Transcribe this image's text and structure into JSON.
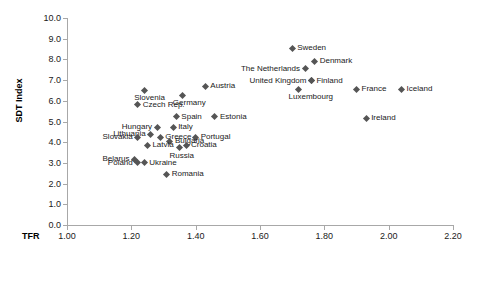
{
  "chart_data": {
    "type": "scatter",
    "title": "",
    "xlabel": "TFR",
    "ylabel": "SDT Index",
    "xlim": [
      1.0,
      2.2
    ],
    "ylim": [
      0.0,
      10.0
    ],
    "xticks": [
      "1.00",
      "1.20",
      "1.40",
      "1.60",
      "1.80",
      "2.00",
      "2.20"
    ],
    "xtick_values": [
      1.0,
      1.2,
      1.4,
      1.6,
      1.8,
      2.0,
      2.2
    ],
    "yticks": [
      "0.0",
      "1.0",
      "2.0",
      "3.0",
      "4.0",
      "5.0",
      "6.0",
      "7.0",
      "8.0",
      "9.0",
      "10.0"
    ],
    "ytick_values": [
      0,
      1,
      2,
      3,
      4,
      5,
      6,
      7,
      8,
      9,
      10
    ],
    "grid": false,
    "legend": "none",
    "marker_color": "#555555",
    "axis_color": "#a8a8a8",
    "points": [
      {
        "label": "Sweden",
        "x": 1.7,
        "y": 8.55,
        "label_pos": "right"
      },
      {
        "label": "Denmark",
        "x": 1.77,
        "y": 7.9,
        "label_pos": "right"
      },
      {
        "label": "The Netherlands",
        "x": 1.74,
        "y": 7.55,
        "label_pos": "left"
      },
      {
        "label": "Finland",
        "x": 1.76,
        "y": 6.98,
        "label_pos": "right"
      },
      {
        "label": "United Kingdom",
        "x": 1.76,
        "y": 6.98,
        "label_pos": "left"
      },
      {
        "label": "Luxembourg",
        "x": 1.72,
        "y": 6.55,
        "label_pos": "below"
      },
      {
        "label": "France",
        "x": 1.9,
        "y": 6.55,
        "label_pos": "right"
      },
      {
        "label": "Iceland",
        "x": 2.04,
        "y": 6.55,
        "label_pos": "right"
      },
      {
        "label": "Austria",
        "x": 1.43,
        "y": 6.7,
        "label_pos": "right"
      },
      {
        "label": "Germany",
        "x": 1.36,
        "y": 6.28,
        "label_pos": "below"
      },
      {
        "label": "Slovenia",
        "x": 1.24,
        "y": 6.52,
        "label_pos": "below"
      },
      {
        "label": "Czech Rep.",
        "x": 1.22,
        "y": 5.8,
        "label_pos": "right"
      },
      {
        "label": "Estonia",
        "x": 1.46,
        "y": 5.22,
        "label_pos": "right"
      },
      {
        "label": "Ireland",
        "x": 1.93,
        "y": 5.15,
        "label_pos": "right"
      },
      {
        "label": "Spain",
        "x": 1.34,
        "y": 5.22,
        "label_pos": "right"
      },
      {
        "label": "Italy",
        "x": 1.33,
        "y": 4.72,
        "label_pos": "right"
      },
      {
        "label": "Hungary",
        "x": 1.28,
        "y": 4.72,
        "label_pos": "left"
      },
      {
        "label": "Lithuania",
        "x": 1.26,
        "y": 4.38,
        "label_pos": "left"
      },
      {
        "label": "Slovakia",
        "x": 1.22,
        "y": 4.25,
        "label_pos": "left"
      },
      {
        "label": "Greece",
        "x": 1.29,
        "y": 4.25,
        "label_pos": "right"
      },
      {
        "label": "Portugal",
        "x": 1.4,
        "y": 4.25,
        "label_pos": "right"
      },
      {
        "label": "Bulgaria",
        "x": 1.32,
        "y": 4.05,
        "label_pos": "right"
      },
      {
        "label": "Croatia",
        "x": 1.37,
        "y": 3.85,
        "label_pos": "right"
      },
      {
        "label": "Latvia",
        "x": 1.25,
        "y": 3.85,
        "label_pos": "right"
      },
      {
        "label": "Russia",
        "x": 1.35,
        "y": 3.72,
        "label_pos": "below"
      },
      {
        "label": "Belarus",
        "x": 1.21,
        "y": 3.18,
        "label_pos": "left"
      },
      {
        "label": "Poland",
        "x": 1.22,
        "y": 3.0,
        "label_pos": "left"
      },
      {
        "label": "Ukraine",
        "x": 1.24,
        "y": 3.0,
        "label_pos": "right"
      },
      {
        "label": "Romania",
        "x": 1.31,
        "y": 2.45,
        "label_pos": "right"
      }
    ]
  }
}
